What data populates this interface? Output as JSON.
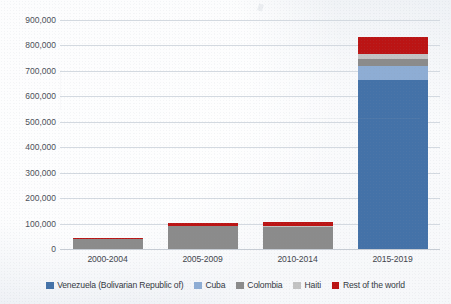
{
  "chart_data": {
    "type": "bar",
    "stacked": true,
    "title": "",
    "xlabel": "",
    "ylabel": "",
    "categories": [
      "2000-2004",
      "2005-2009",
      "2010-2014",
      "2015-2019"
    ],
    "series": [
      {
        "name": "Venezuela (Bolivarian Republic of)",
        "color": "#4472a8",
        "values": [
          0,
          0,
          0,
          665000
        ]
      },
      {
        "name": "Cuba",
        "color": "#8eadd4",
        "values": [
          0,
          0,
          0,
          55000
        ]
      },
      {
        "name": "Colombia",
        "color": "#8b8b8b",
        "values": [
          38000,
          90000,
          88000,
          25000
        ]
      },
      {
        "name": "Haiti",
        "color": "#c3c3c3",
        "values": [
          2000,
          2000,
          2000,
          22000
        ]
      },
      {
        "name": "Rest of the world",
        "color": "#bb1414",
        "values": [
          5000,
          11000,
          16000,
          66000
        ]
      }
    ],
    "totals": [
      45000,
      103000,
      106000,
      833000
    ],
    "ylim": [
      0,
      900000
    ],
    "yticks": [
      0,
      100000,
      200000,
      300000,
      400000,
      500000,
      600000,
      700000,
      800000,
      900000
    ],
    "ytick_labels": [
      "0",
      "100,000",
      "200,000",
      "300,000",
      "400,000",
      "500,000",
      "600,000",
      "700,000",
      "800,000",
      "900,000"
    ],
    "grid": true,
    "legend_position": "bottom"
  },
  "legend": {
    "items": [
      {
        "label": "Venezuela (Bolivarian Republic of)",
        "color": "#4472a8"
      },
      {
        "label": "Cuba",
        "color": "#8eadd4"
      },
      {
        "label": "Colombia",
        "color": "#8b8b8b"
      },
      {
        "label": "Haiti",
        "color": "#c3c3c3"
      },
      {
        "label": "Rest of the world",
        "color": "#bb1414"
      }
    ]
  },
  "colors": {
    "background": "#eef1f5",
    "gridline": "#d3d9e0",
    "tick_text": "#4b5059"
  }
}
